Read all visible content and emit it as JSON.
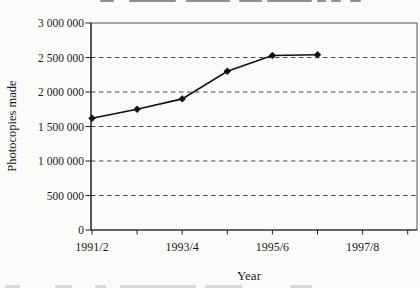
{
  "axis_titles": {
    "x": "Year",
    "y": "Photocopies made"
  },
  "chart_data": {
    "type": "line",
    "title": "",
    "xlabel": "Year",
    "ylabel": "Photocopies made",
    "categories": [
      "1991/2",
      "1992/3",
      "1993/4",
      "1994/5",
      "1995/6",
      "1996/7",
      "1997/8"
    ],
    "x_tick_labels_shown": [
      "1991/2",
      "1993/4",
      "1995/6",
      "1997/8"
    ],
    "values": [
      1620000,
      1750000,
      1900000,
      2300000,
      2530000,
      2540000,
      null
    ],
    "ylim": [
      0,
      3000000
    ],
    "y_ticks": [
      0,
      500000,
      1000000,
      1500000,
      2000000,
      2500000,
      3000000
    ],
    "y_tick_labels": [
      "0",
      "500 000",
      "1 000 000",
      "1 500 000",
      "2 000 000",
      "2 500 000",
      "3 000 000"
    ],
    "grid": "horizontal-dashed",
    "legend": "none",
    "marker": "diamond",
    "colors": {
      "line": "#111111",
      "marker": "#111111",
      "grid": "#4d4d4d",
      "frame": "#555555",
      "axis": "#222222",
      "text": "#1b1b1b"
    }
  }
}
